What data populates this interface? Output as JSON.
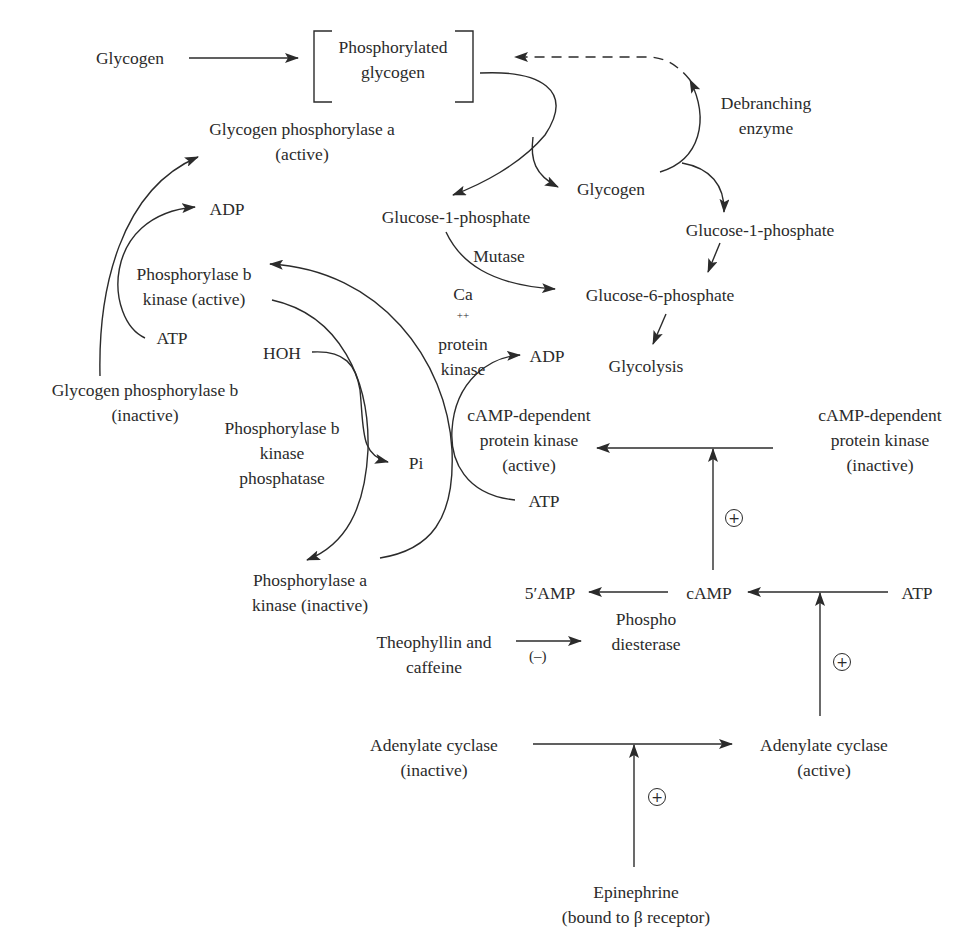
{
  "diagram": {
    "nodes": {
      "glycogen_top": "Glycogen",
      "phosphorylated_glycogen": [
        "Phosphorylated",
        "glycogen"
      ],
      "glycogen_phosphorylase_a": [
        "Glycogen phosphorylase a",
        "(active)"
      ],
      "adp_left": "ADP",
      "glucose_1_phosphate_left": "Glucose-1-phosphate",
      "glycogen_mid": "Glycogen",
      "debranching_enzyme": [
        "Debranching",
        "enzyme"
      ],
      "glucose_1_phosphate_right": "Glucose-1-phosphate",
      "mutase": "Mutase",
      "glucose_6_phosphate": "Glucose-6-phosphate",
      "glycolysis": "Glycolysis",
      "phosphorylase_b_kinase_active": [
        "Phosphorylase b",
        "kinase (active)"
      ],
      "ca_protein_kinase": [
        "Ca",
        "++",
        "protein",
        "kinase"
      ],
      "atp_left": "ATP",
      "hoh": "HOH",
      "glycogen_phosphorylase_b": [
        "Glycogen phosphorylase b",
        "(inactive)"
      ],
      "phosphorylase_b_kinase_phosphatase": [
        "Phosphorylase b",
        "kinase",
        "phosphatase"
      ],
      "pi": "Pi",
      "adp_mid": "ADP",
      "camp_pk_active": [
        "cAMP-dependent",
        "protein kinase",
        "(active)"
      ],
      "atp_mid": "ATP",
      "camp_pk_inactive": [
        "cAMP-dependent",
        "protein kinase",
        "(inactive)"
      ],
      "phosphorylase_a_kinase_inactive": [
        "Phosphorylase a",
        "kinase (inactive)"
      ],
      "five_amp": "5′AMP",
      "camp": "cAMP",
      "atp_right": "ATP",
      "phosphodiesterase": [
        "Phospho",
        "diesterase"
      ],
      "theophyllin_caffeine": [
        "Theophyllin and",
        "caffeine"
      ],
      "minus_sign": "(–)",
      "adenylate_cyclase_inactive": [
        "Adenylate cyclase",
        "(inactive)"
      ],
      "adenylate_cyclase_active": [
        "Adenylate cyclase",
        "(active)"
      ],
      "epinephrine": [
        "Epinephrine",
        "(bound to β receptor)"
      ]
    },
    "stimulation_marks": [
      "+",
      "+",
      "+"
    ],
    "colors": {
      "ink": "#2b2b2b",
      "background": "#ffffff"
    }
  }
}
